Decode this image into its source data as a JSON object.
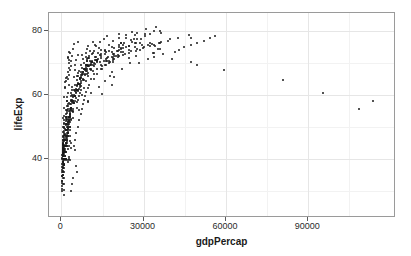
{
  "chart_data": {
    "type": "scatter",
    "title": "",
    "xlabel": "gdpPercap",
    "ylabel": "lifeExp",
    "xlim": [
      -4500,
      122000
    ],
    "ylim": [
      21.5,
      85.5
    ],
    "xticks": [
      0,
      30000,
      60000,
      90000
    ],
    "xtick_labels": [
      "0",
      "30000",
      "60000",
      "90000"
    ],
    "yticks": [
      40,
      60,
      80
    ],
    "ytick_labels": [
      "40",
      "60",
      "80"
    ],
    "x_minor_ticks": [
      15000,
      45000,
      75000,
      105000
    ],
    "y_minor_ticks": [
      30,
      50,
      70,
      80
    ],
    "grid": true,
    "legend": null,
    "point_color": "#1a1a1a",
    "point_size_px": 2,
    "panel_background": "#ffffff",
    "grid_major_color": "#e6e6e6",
    "grid_minor_color": "#f2f2f2",
    "panel_border_color": "#9a9a9a",
    "n_points": 1704,
    "series": [
      {
        "name": "countries",
        "x": [
          779,
          821,
          853,
          836,
          740,
          978,
          852,
          649,
          635,
          727,
          787,
          975,
          1601,
          1942,
          2312,
          2760,
          3313,
          3533,
          3631,
          3739,
          2497,
          3193,
          4604,
          5937,
          2449,
          3014,
          2551,
          3247,
          4183,
          4910,
          5745,
          5681,
          5023,
          4797,
          5288,
          6223,
          3521,
          3828,
          4269,
          5523,
          5473,
          3009,
          2757,
          2430,
          2627,
          2277,
          2773,
          4797,
          1389,
          1536,
          1738,
          2055,
          2335,
          2678,
          2864,
          2729,
          2242,
          2924,
          4172,
          12779,
          10040,
          10950,
          12217,
          16121,
          18578,
          20445,
          21860,
          21888,
          23425,
          26998,
          30688,
          34435,
          6137,
          8843,
          10751,
          12835,
          16662,
          19749,
          21597,
          23688,
          27042,
          29096,
          32418,
          36126,
          9867,
          11636,
          12079,
          14227,
          16172,
          19007,
          18363,
          21050,
          22898,
          26626,
          30470,
          33693,
          684,
          661,
          686,
          721,
          630,
          660,
          676,
          751,
          838,
          973,
          1136,
          1391,
          9541,
          10865,
          13583,
          15937,
          17861,
          18533,
          14816,
          18661,
          24769,
          33519,
          36023,
          33693,
          8343,
          9715,
          10991,
          13149,
          16672,
          19117,
          20980,
          22526,
          25576,
          27561,
          30486,
          36180,
          2444,
          3008,
          4254,
          5577,
          6597,
          7133,
          7051,
          5962,
          6248,
          7114,
          7765,
          7446,
          3217,
          4317,
          6576,
          9848,
          14778,
          18268,
          19340,
          22066,
          24837,
          27195,
          28771,
          31656,
          4293,
          5226,
          5722,
          6811,
          8042,
          9138,
          9308,
          8828,
          9139,
          9308,
          9786,
          11415,
          4079,
          4856,
          5926,
          7281,
          9163,
          10949,
          12547,
          14195,
          15992,
          18604,
          21841,
          25523,
          7144,
          8243,
          9601,
          11316,
          13236,
          14618,
          15722,
          17411,
          18701,
          20999,
          23455,
          27538,
          2864,
          3370,
          4303,
          5396,
          6697,
          8163,
          9328,
          10595,
          11640,
          12820,
          14387,
          16090,
          5263,
          6035,
          6749,
          7972,
          8691,
          8927,
          8963,
          9252,
          10053,
          11004,
          12000,
          13572,
          3758,
          4254,
          5045,
          6105,
          6901,
          7086,
          7161,
          7330,
          8156,
          9165,
          10135,
          11403,
          2108,
          2488,
          3007,
          3638,
          4438,
          5071,
          5680,
          6180,
          6847,
          7676,
          8655,
          9786,
          1688,
          1877,
          2153,
          2564,
          3060,
          3546,
          4023,
          4562,
          5168,
          5936,
          6776,
          7703,
          1208,
          1385,
          1663,
          2029,
          2435,
          2784,
          3093,
          3348,
          3726,
          4300,
          4918,
          5605,
          1421,
          1644,
          1919,
          2265,
          2696,
          3084,
          3375,
          3612,
          3981,
          4530,
          5123,
          5773,
          875,
          963,
          1075,
          1191,
          1310,
          1407,
          1494,
          1577,
          1676,
          1789,
          1906,
          2042,
          520,
          567,
          615,
          663,
          712,
          756,
          797,
          841,
          890,
          944,
          1000,
          1056,
          331,
          350,
          388,
          349,
          357,
          371,
          424,
          385,
          347,
          415,
          512,
          641,
          1062,
          960,
          949,
          1035,
          1085,
          1071,
          1014,
          1005,
          920,
          857,
          932,
          1044,
          485,
          524,
          521,
          621,
          607,
          512,
          625,
          534,
          556,
          577,
          591,
          579,
          2316,
          2027,
          2247,
          2924,
          4720,
          10618,
          11848,
          12569,
          33693,
          21905,
          24672,
          28821,
          1468,
          1395,
          1538,
          1621,
          1813,
          1989,
          2066,
          1972,
          1879,
          2117,
          2234,
          2452,
          1077,
          1100,
          1150,
          1014,
          1698,
          1981,
          1576,
          1385,
          1619,
          1624,
          1615,
          1598,
          2125,
          2315,
          2484,
          2720,
          2866,
          3021,
          3178,
          3326,
          3486,
          3660,
          3845,
          4043,
          3099,
          3536,
          4050,
          4510,
          5045,
          5678,
          6270,
          6929,
          7667,
          8476,
          9373,
          10362,
          5586,
          6092,
          6650,
          7240,
          7906,
          8620,
          9405,
          10261,
          11199,
          12217,
          13335,
          14554,
          7429,
          8163,
          8968,
          9848,
          10818,
          11883,
          13054,
          14343,
          15759,
          17316,
          19029,
          20910,
          9979,
          10918,
          11946,
          13072,
          14304,
          15652,
          17129,
          18745,
          20514,
          22450,
          24568,
          26886,
          12021,
          13149,
          14384,
          15735,
          17211,
          18827,
          20593,
          22525,
          24636,
          26945,
          29470,
          32232,
          14734,
          16118,
          17632,
          19288,
          21100,
          23080,
          25246,
          27614,
          30204,
          33037,
          36133,
          39525,
          17262,
          18881,
          20654,
          22594,
          24718,
          27043,
          29588,
          32374,
          35423,
          38761,
          42414,
          46410,
          4600,
          5100,
          5500,
          6100,
          6600,
          7000,
          7400,
          7800,
          8200,
          8700,
          9100,
          9600,
          1500,
          1700,
          1900,
          2100,
          2300,
          2500,
          2700,
          2900,
          3100,
          3300,
          3500,
          3700,
          800,
          900,
          1000,
          1100,
          1200,
          1300,
          1400,
          1500,
          1600,
          1700,
          1800,
          1900,
          400,
          450,
          500,
          550,
          600,
          650,
          700,
          750,
          800,
          850,
          900,
          950,
          250,
          280,
          310,
          340,
          370,
          400,
          430,
          460,
          490,
          520,
          550,
          580,
          108382,
          113523,
          95458,
          80895,
          59265,
          49357,
          47307,
          40300,
          35110,
          34167,
          36023,
          47307,
          28452,
          31540,
          33860,
          37000,
          41283,
          43000,
          44597,
          47143,
          49357,
          52000,
          54000,
          56000,
          6459,
          7157,
          8019,
          8863,
          9787,
          10330,
          12281,
          14083,
          15448,
          16689,
          20896,
          25768,
          1688,
          1642,
          1566,
          1711,
          1930,
          2370,
          2603,
          2189,
          2340,
          2672,
          3054,
          3421,
          2041,
          2161,
          2294,
          2419,
          2529,
          2674,
          2799,
          2898,
          3040,
          3191,
          3348,
          3512
        ],
        "y": [
          28.8,
          30.3,
          32.0,
          34.0,
          36.1,
          38.4,
          39.9,
          40.8,
          41.7,
          41.8,
          42.1,
          43.8,
          55.2,
          59.3,
          64.8,
          66.2,
          67.7,
          68.9,
          70.4,
          72.0,
          71.6,
          72.9,
          75.7,
          76.4,
          43.1,
          45.7,
          48.3,
          51.4,
          54.5,
          58.0,
          61.4,
          65.8,
          67.7,
          69.2,
          70.9,
          72.3,
          30.0,
          32.0,
          34.0,
          36.0,
          37.9,
          39.5,
          39.9,
          39.5,
          40.6,
          39.0,
          44.0,
          42.7,
          62.5,
          64.4,
          65.1,
          65.6,
          67.1,
          68.5,
          69.9,
          70.8,
          71.9,
          73.3,
          74.3,
          75.3,
          69.1,
          70.3,
          70.9,
          71.1,
          71.9,
          73.5,
          74.7,
          76.3,
          77.6,
          78.8,
          80.4,
          81.2,
          66.8,
          67.5,
          69.5,
          70.1,
          70.6,
          72.2,
          73.2,
          74.9,
          76.1,
          77.5,
          78.9,
          79.8,
          66.8,
          67.5,
          69.5,
          70.1,
          70.6,
          72.2,
          73.2,
          74.9,
          76.1,
          77.5,
          78.9,
          80.0,
          37.5,
          39.3,
          41.2,
          43.5,
          45.3,
          46.9,
          50.0,
          52.8,
          56.0,
          59.4,
          62.0,
          64.1,
          58.0,
          60.4,
          62.3,
          64.4,
          65.8,
          67.1,
          69.0,
          70.3,
          71.5,
          73.0,
          74.3,
          75.6,
          68.0,
          69.2,
          70.2,
          70.9,
          71.4,
          72.8,
          73.9,
          75.4,
          76.5,
          77.5,
          78.3,
          79.4,
          50.9,
          53.3,
          55.7,
          57.6,
          59.5,
          61.5,
          63.7,
          66.0,
          67.4,
          69.4,
          71.0,
          72.4,
          49.0,
          52.6,
          55.1,
          57.7,
          60.3,
          63.0,
          65.5,
          67.9,
          70.0,
          72.0,
          73.9,
          75.6,
          57.9,
          60.8,
          63.0,
          65.2,
          67.1,
          68.8,
          70.4,
          71.9,
          73.0,
          74.3,
          75.3,
          76.4,
          59.2,
          61.4,
          63.6,
          65.5,
          67.4,
          69.3,
          70.9,
          72.5,
          73.8,
          75.0,
          76.0,
          77.0,
          66.3,
          67.9,
          69.1,
          70.3,
          71.2,
          72.8,
          74.1,
          75.5,
          76.8,
          77.8,
          78.8,
          79.4,
          53.0,
          55.5,
          58.0,
          60.4,
          62.5,
          64.6,
          66.4,
          68.0,
          69.4,
          70.8,
          72.1,
          73.3,
          59.1,
          61.1,
          63.0,
          64.8,
          66.4,
          67.9,
          69.3,
          70.5,
          71.6,
          72.7,
          73.7,
          74.7,
          55.0,
          57.3,
          59.5,
          61.6,
          63.5,
          65.3,
          67.0,
          68.5,
          69.8,
          71.0,
          72.1,
          73.1,
          48.0,
          50.5,
          52.9,
          55.2,
          57.4,
          59.5,
          61.4,
          63.2,
          64.8,
          66.3,
          67.7,
          69.0,
          44.0,
          46.5,
          49.0,
          51.4,
          53.7,
          55.9,
          58.0,
          60.0,
          61.8,
          63.5,
          65.1,
          66.6,
          40.0,
          42.5,
          45.0,
          47.4,
          49.7,
          51.9,
          54.0,
          56.0,
          57.8,
          59.5,
          61.1,
          62.6,
          42.0,
          44.5,
          47.0,
          49.4,
          51.7,
          53.9,
          56.0,
          58.0,
          59.8,
          61.5,
          63.1,
          64.6,
          38.0,
          40.0,
          42.0,
          44.0,
          45.9,
          47.7,
          49.4,
          51.0,
          52.5,
          53.9,
          55.2,
          56.4,
          35.0,
          37.0,
          39.0,
          41.0,
          42.9,
          44.7,
          46.4,
          48.0,
          49.5,
          50.9,
          52.2,
          53.4,
          30.0,
          31.5,
          33.0,
          34.5,
          36.0,
          37.4,
          38.7,
          40.0,
          41.2,
          42.3,
          43.3,
          44.3,
          37.0,
          38.5,
          40.0,
          41.5,
          43.0,
          44.4,
          45.7,
          47.0,
          46.0,
          44.0,
          43.0,
          42.6,
          32.0,
          34.0,
          36.0,
          38.0,
          40.0,
          42.0,
          44.0,
          45.0,
          44.0,
          43.0,
          42.0,
          41.5,
          55.6,
          58.0,
          60.5,
          63.0,
          65.5,
          68.0,
          70.0,
          71.8,
          73.0,
          74.2,
          75.2,
          76.2,
          41.0,
          43.0,
          45.0,
          47.0,
          49.0,
          51.0,
          52.5,
          53.0,
          52.0,
          50.0,
          48.0,
          47.0,
          38.0,
          39.5,
          41.0,
          42.5,
          44.0,
          45.5,
          46.5,
          46.0,
          44.0,
          42.0,
          40.0,
          39.6,
          45.0,
          47.0,
          49.0,
          51.0,
          53.0,
          55.0,
          57.0,
          58.5,
          59.5,
          60.5,
          61.5,
          62.5,
          50.0,
          52.5,
          55.0,
          57.3,
          59.5,
          61.5,
          63.3,
          65.0,
          66.5,
          67.9,
          69.2,
          70.4,
          56.0,
          58.4,
          60.6,
          62.7,
          64.6,
          66.3,
          67.9,
          69.3,
          70.6,
          71.8,
          72.9,
          73.9,
          60.0,
          62.2,
          64.2,
          66.0,
          67.6,
          69.1,
          70.4,
          71.6,
          72.7,
          73.7,
          74.6,
          75.5,
          63.0,
          64.9,
          66.6,
          68.1,
          69.4,
          70.6,
          71.7,
          72.7,
          73.6,
          74.5,
          75.3,
          76.1,
          65.0,
          66.6,
          68.0,
          69.3,
          70.4,
          71.4,
          72.3,
          73.2,
          74.0,
          74.8,
          75.6,
          76.3,
          68.0,
          69.2,
          70.3,
          71.2,
          72.0,
          72.8,
          73.6,
          74.3,
          75.0,
          75.8,
          76.6,
          77.4,
          70.0,
          70.9,
          71.7,
          72.4,
          73.1,
          73.8,
          74.5,
          75.2,
          76.0,
          76.8,
          77.7,
          78.6,
          44.0,
          46.0,
          48.0,
          50.0,
          52.0,
          54.0,
          55.5,
          57.0,
          58.3,
          59.6,
          60.8,
          62.0,
          40.0,
          42.0,
          44.0,
          46.0,
          48.0,
          49.8,
          51.5,
          53.0,
          54.4,
          55.7,
          57.0,
          58.2,
          36.0,
          38.0,
          40.0,
          42.0,
          44.0,
          45.8,
          47.5,
          49.0,
          50.4,
          51.7,
          53.0,
          54.2,
          33.0,
          35.0,
          37.0,
          39.0,
          41.0,
          42.8,
          44.5,
          46.0,
          47.4,
          48.7,
          50.0,
          51.2,
          30.5,
          32.5,
          34.5,
          36.5,
          38.5,
          40.2,
          41.8,
          43.3,
          44.7,
          46.0,
          47.2,
          48.4,
          55.6,
          58.0,
          60.5,
          64.6,
          67.7,
          69.3,
          70.3,
          71.3,
          74.2,
          75.2,
          76.0,
          77.6,
          70.0,
          71.0,
          71.9,
          72.7,
          73.4,
          74.1,
          74.8,
          75.5,
          76.2,
          76.9,
          77.6,
          78.3,
          61.7,
          64.4,
          67.0,
          69.4,
          71.6,
          73.6,
          75.4,
          76.5,
          77.5,
          78.3,
          79.0,
          79.6,
          47.0,
          49.0,
          51.0,
          53.0,
          55.0,
          56.5,
          57.5,
          58.0,
          57.0,
          55.0,
          53.0,
          52.0,
          44.0,
          46.0,
          48.0,
          50.0,
          51.5,
          52.5,
          53.0,
          52.0,
          50.0,
          47.0,
          45.0,
          43.5
        ]
      }
    ]
  },
  "axis": {
    "x_title": "gdpPercap",
    "y_title": "lifeExp"
  }
}
